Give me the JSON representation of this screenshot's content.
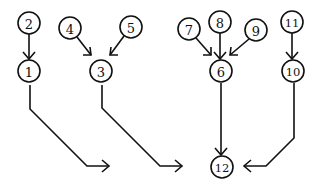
{
  "diagram": {
    "type": "tree",
    "nodes": [
      {
        "id": "1",
        "label": "1",
        "x": 29,
        "y": 71,
        "r": 11
      },
      {
        "id": "2",
        "label": "2",
        "x": 29,
        "y": 23,
        "r": 11
      },
      {
        "id": "3",
        "label": "3",
        "x": 101,
        "y": 71,
        "r": 11
      },
      {
        "id": "4",
        "label": "4",
        "x": 70,
        "y": 28,
        "r": 11
      },
      {
        "id": "5",
        "label": "5",
        "x": 131,
        "y": 27,
        "r": 11
      },
      {
        "id": "6",
        "label": "6",
        "x": 221,
        "y": 71,
        "r": 11
      },
      {
        "id": "7",
        "label": "7",
        "x": 189,
        "y": 29,
        "r": 11
      },
      {
        "id": "8",
        "label": "8",
        "x": 220,
        "y": 22,
        "r": 11
      },
      {
        "id": "9",
        "label": "9",
        "x": 256,
        "y": 30,
        "r": 11
      },
      {
        "id": "10",
        "label": "10",
        "x": 293,
        "y": 71,
        "r": 11
      },
      {
        "id": "11",
        "label": "11",
        "x": 292,
        "y": 22,
        "r": 11
      },
      {
        "id": "12",
        "label": "12",
        "x": 222,
        "y": 167,
        "r": 11
      }
    ],
    "edges": [
      {
        "from": "2",
        "to": "1"
      },
      {
        "from": "4",
        "to": "3"
      },
      {
        "from": "5",
        "to": "3"
      },
      {
        "from": "7",
        "to": "6"
      },
      {
        "from": "8",
        "to": "6"
      },
      {
        "from": "9",
        "to": "6"
      },
      {
        "from": "11",
        "to": "10"
      },
      {
        "from": "1",
        "to": "12"
      },
      {
        "from": "3",
        "to": "12"
      },
      {
        "from": "6",
        "to": "12"
      },
      {
        "from": "10",
        "to": "12"
      }
    ],
    "colors": {
      "stroke": "#111111",
      "background": "#ffffff"
    }
  }
}
